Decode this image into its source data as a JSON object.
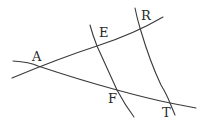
{
  "diagram": {
    "type": "geometry",
    "points": [
      {
        "name": "A",
        "label": "A",
        "x": 38,
        "y": 66,
        "lx": 32,
        "ly": 61
      },
      {
        "name": "E",
        "label": "E",
        "x": 97,
        "y": 46,
        "lx": 99,
        "ly": 37
      },
      {
        "name": "R",
        "label": "R",
        "x": 140,
        "y": 28,
        "lx": 141,
        "ly": 20
      },
      {
        "name": "F",
        "label": "F",
        "x": 117,
        "y": 90,
        "lx": 108,
        "ly": 103
      },
      {
        "name": "T",
        "label": "T",
        "x": 170,
        "y": 103,
        "lx": 162,
        "ly": 117
      }
    ],
    "lines": [
      {
        "name": "line-AER",
        "through": [
          "A",
          "E",
          "R"
        ],
        "d": "M12,78 Q60,58 97,46 T163,17"
      },
      {
        "name": "line-AFT",
        "through": [
          "A",
          "F",
          "T"
        ],
        "d": "M13,61 Q30,62 38,66 Q80,80 117,90 Q150,99 170,103 L196,108"
      },
      {
        "name": "line-EF",
        "through": [
          "E",
          "F"
        ],
        "d": "M90,25 Q93,36 97,46 Q108,70 117,90 Q125,105 134,117"
      },
      {
        "name": "line-RT",
        "through": [
          "R",
          "T"
        ],
        "d": "M135,8 Q137,18 140,28 Q150,62 161,85 Q167,95 170,103 L175,115"
      }
    ],
    "stroke_color": "#3a3a3a"
  }
}
